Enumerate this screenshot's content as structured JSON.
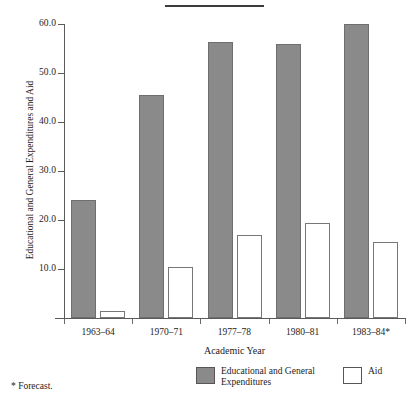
{
  "figure": {
    "title_rule_present": true,
    "footnote": "* Forecast."
  },
  "legend": {
    "position": "bottom-center",
    "entries": [
      {
        "swatch": "gray-filled-square",
        "label": "Educational and General Expenditures"
      },
      {
        "swatch": "white-outlined-square",
        "label": "Aid"
      }
    ]
  },
  "chart_data": {
    "type": "bar",
    "title": "",
    "xlabel": "Academic Year",
    "ylabel": "Educational and General Expenditures and Aid",
    "categories": [
      "1963–64",
      "1970–71",
      "1977–78",
      "1980–81",
      "1983–84*"
    ],
    "series": [
      {
        "name": "Educational and General Expenditures",
        "color": "#8a8a8a",
        "values": [
          24.0,
          45.5,
          56.3,
          56.0,
          60.0
        ]
      },
      {
        "name": "Aid",
        "color": "#ffffff",
        "values": [
          1.5,
          10.5,
          17.0,
          19.3,
          15.5
        ]
      }
    ],
    "ylim": [
      0,
      60
    ],
    "ytick_labels": [
      "60.0",
      "50.0",
      "40.0",
      "30.0",
      "20.0",
      "10.0"
    ],
    "ytick_values": [
      60,
      50,
      40,
      30,
      20,
      10
    ],
    "grid": false,
    "annotations": [
      "* Forecast."
    ]
  }
}
